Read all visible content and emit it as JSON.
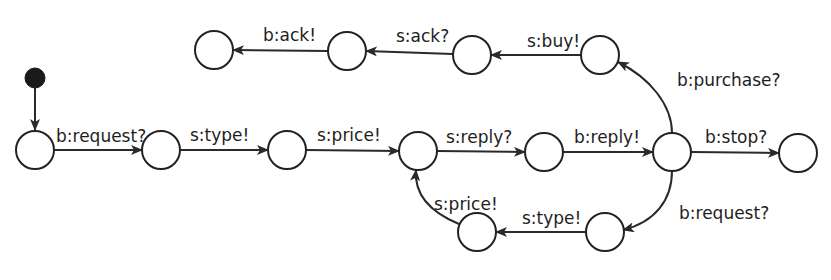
{
  "diagram": {
    "type": "state-machine",
    "colors": {
      "stroke": "#222222",
      "text": "#1e1e1e",
      "background": "#ffffff",
      "initial": "#1a1a1a"
    },
    "initial": {
      "id": "init",
      "cx": 35,
      "cy": 78,
      "r": 10,
      "target": "q0"
    },
    "states": [
      {
        "id": "q0",
        "cx": 35,
        "cy": 150,
        "r": 19
      },
      {
        "id": "q1",
        "cx": 161,
        "cy": 150,
        "r": 19
      },
      {
        "id": "q2",
        "cx": 287,
        "cy": 150,
        "r": 19
      },
      {
        "id": "q3",
        "cx": 418,
        "cy": 151,
        "r": 19
      },
      {
        "id": "q4",
        "cx": 544,
        "cy": 152,
        "r": 19
      },
      {
        "id": "q5",
        "cx": 672,
        "cy": 152,
        "r": 19
      },
      {
        "id": "q6",
        "cx": 798,
        "cy": 153,
        "r": 19
      },
      {
        "id": "q7",
        "cx": 600,
        "cy": 55,
        "r": 19
      },
      {
        "id": "q8",
        "cx": 472,
        "cy": 55,
        "r": 19
      },
      {
        "id": "q9",
        "cx": 347,
        "cy": 51,
        "r": 19
      },
      {
        "id": "q10",
        "cx": 214,
        "cy": 50,
        "r": 19
      },
      {
        "id": "q11",
        "cx": 605,
        "cy": 232,
        "r": 19
      },
      {
        "id": "q12",
        "cx": 477,
        "cy": 232,
        "r": 19
      }
    ],
    "transitions": [
      {
        "from": "q0",
        "to": "q1",
        "label": "b:request?"
      },
      {
        "from": "q1",
        "to": "q2",
        "label": "s:type!"
      },
      {
        "from": "q2",
        "to": "q3",
        "label": "s:price!"
      },
      {
        "from": "q3",
        "to": "q4",
        "label": "s:reply?"
      },
      {
        "from": "q4",
        "to": "q5",
        "label": "b:reply!"
      },
      {
        "from": "q5",
        "to": "q6",
        "label": "b:stop?"
      },
      {
        "from": "q5",
        "to": "q7",
        "label": "b:purchase?"
      },
      {
        "from": "q7",
        "to": "q8",
        "label": "s:buy!"
      },
      {
        "from": "q8",
        "to": "q9",
        "label": "s:ack?"
      },
      {
        "from": "q9",
        "to": "q10",
        "label": "b:ack!"
      },
      {
        "from": "q5",
        "to": "q11",
        "label": "b:request?"
      },
      {
        "from": "q11",
        "to": "q12",
        "label": "s:type!"
      },
      {
        "from": "q12",
        "to": "q3",
        "label": "s:price!"
      }
    ]
  }
}
